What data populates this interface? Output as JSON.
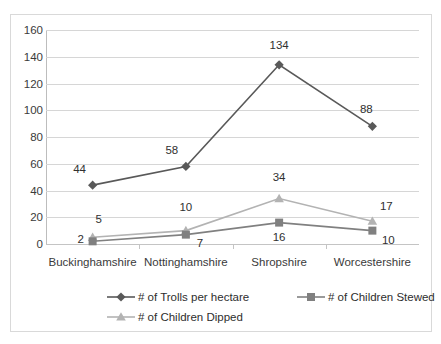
{
  "chart_data": {
    "type": "line",
    "title": "",
    "xlabel": "",
    "ylabel": "",
    "ylim": [
      0,
      160
    ],
    "ytick_step": 20,
    "yticks": [
      "0",
      "20",
      "40",
      "60",
      "80",
      "100",
      "120",
      "140",
      "160"
    ],
    "grid": true,
    "legend_position": "bottom",
    "categories": [
      "Buckinghamshire",
      "Nottinghamshire",
      "Shropshire",
      "Worcestershire"
    ],
    "series": [
      {
        "name": "# of Trolls per hectare",
        "marker": "diamond",
        "color": "#595959",
        "values": [
          44,
          58,
          134,
          88
        ],
        "labels": [
          "44",
          "58",
          "134",
          "88"
        ]
      },
      {
        "name": "# of Children Stewed",
        "marker": "square",
        "color": "#808080",
        "values": [
          2,
          7,
          16,
          10
        ],
        "labels": [
          "2",
          "7",
          "16",
          "10"
        ]
      },
      {
        "name": "# of Children Dipped",
        "marker": "triangle",
        "color": "#b3b3b3",
        "values": [
          5,
          10,
          34,
          17
        ],
        "labels": [
          "5",
          "10",
          "34",
          "17"
        ]
      }
    ]
  },
  "legend": {
    "items": [
      {
        "label": "# of Trolls per hectare",
        "marker": "diamond-marker-icon",
        "color": "#595959"
      },
      {
        "label": "# of Children Stewed",
        "marker": "square-marker-icon",
        "color": "#808080"
      },
      {
        "label": "# of Children Dipped",
        "marker": "triangle-marker-icon",
        "color": "#b3b3b3"
      }
    ]
  },
  "colors": {
    "gridline": "#d6d6d6",
    "axis": "#bdbdbd",
    "border": "#d9d9d9",
    "text": "#3a3a3a",
    "background": "#ffffff"
  }
}
